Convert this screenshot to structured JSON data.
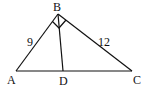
{
  "diagram": {
    "type": "geometry-triangle",
    "colors": {
      "stroke": "#111111",
      "background": "#ffffff"
    },
    "points": {
      "A": {
        "label": "A",
        "x": 16,
        "y": 71,
        "label_x": 7,
        "label_y": 84
      },
      "B": {
        "label": "B",
        "x": 58,
        "y": 14,
        "label_x": 53,
        "label_y": 11
      },
      "C": {
        "label": "C",
        "x": 132,
        "y": 71,
        "label_x": 133,
        "label_y": 84
      },
      "D": {
        "label": "D",
        "x": 63,
        "y": 71,
        "label_x": 59,
        "label_y": 85
      }
    },
    "segments": [
      {
        "from": "A",
        "to": "B"
      },
      {
        "from": "B",
        "to": "C"
      },
      {
        "from": "A",
        "to": "C"
      },
      {
        "from": "B",
        "to": "D"
      }
    ],
    "side_labels": [
      {
        "text": "9",
        "side": "AB",
        "x": 27,
        "y": 46
      },
      {
        "text": "12",
        "side": "BC",
        "x": 98,
        "y": 46
      }
    ],
    "right_angle_marker": {
      "vertex": "B",
      "angle": "ABC"
    }
  }
}
